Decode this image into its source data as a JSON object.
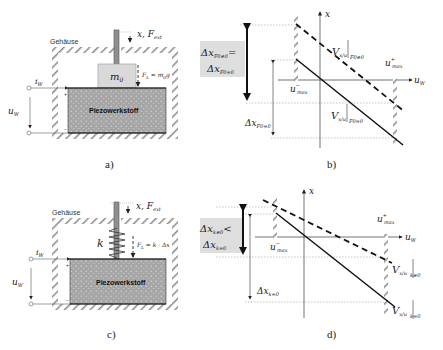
{
  "panels": {
    "a": {
      "caption": "a)",
      "housing_label": "Gehäuse",
      "piezo_label": "Piezowerkstoff",
      "mass_label": "m0",
      "force_label": "x, F_ext",
      "load_label": "F_L = m_0 g",
      "current_label": "i_W",
      "voltage_label": "u_W",
      "plus": "+",
      "minus": "−"
    },
    "b": {
      "caption": "b)",
      "box_line1": "Δx_F0≠0 =",
      "box_line2": "Δx_F0=0",
      "x_axis": "x",
      "u_axis": "u_W",
      "u_max_minus": "u⁻max",
      "u_max_plus": "u⁺max",
      "curve_dashed": "V_x/u |F0≠0",
      "curve_solid": "V_x/u |F0=0",
      "delta_label": "Δx_F0=0"
    },
    "c": {
      "caption": "c)",
      "housing_label": "Gehäuse",
      "piezo_label": "Piezowerkstoff",
      "spring_label": "k",
      "force_label": "x, F_ext",
      "load_label": "F_L = k · Δx",
      "current_label": "i_W",
      "voltage_label": "u_W",
      "plus": "+",
      "minus": "−"
    },
    "d": {
      "caption": "d)",
      "box_line1": "Δx_k≠0 <",
      "box_line2": "Δx_k=0",
      "x_axis": "x",
      "u_axis": "u_W",
      "u_max_minus": "u⁻max",
      "u_max_plus": "u⁺max",
      "curve_dashed": "V_x/u |k≠0",
      "curve_solid": "V_x/u |k=0",
      "delta_label": "Δx_k=0"
    }
  },
  "colors": {
    "piezo_fill": "#a9a9a9",
    "mass_fill": "#d9d9d9",
    "box_fill": "#dedede",
    "line": "#111111",
    "dotted": "#777777"
  }
}
